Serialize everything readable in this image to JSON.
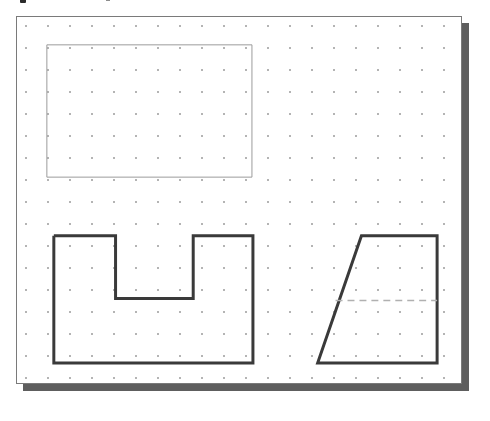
{
  "document": {
    "title": "Engineering drawing sheet",
    "background_color": "#ffffff"
  },
  "top_artifacts": [
    {
      "name": "cut-off-mark-left",
      "label": ""
    },
    {
      "name": "cut-off-mark-right",
      "label": ""
    }
  ],
  "canvas": {
    "name": "drawing-canvas",
    "x": 16,
    "y": 16,
    "width": 446,
    "height": 368,
    "fill_color": "#ffffff",
    "border_color": "#7a7a7a",
    "shadow_color": "#5e5e5e",
    "shadow_offset": 7
  },
  "grid": {
    "name": "dot-grid",
    "type": "dots",
    "spacing": 22,
    "dot_color": "#b4b4b4",
    "dot_radius": 1,
    "origin_x": 8,
    "origin_y": 8
  },
  "shapes": [
    {
      "id": "rectangle",
      "name": "rectangle-outline",
      "kind": "rectangle",
      "stroke_color": "#9a9a9a",
      "stroke_width": 1,
      "fill": "none",
      "x": 30,
      "y": 28,
      "width": 206,
      "height": 133,
      "points": "30,28 236,28 236,161 30,161 30,28"
    },
    {
      "id": "u-channel",
      "name": "u-channel-profile",
      "kind": "polygon",
      "stroke_color": "#3a3a3a",
      "stroke_width": 3,
      "fill": "none",
      "points": "37,220 99,220 99,283 177,283 177,220 237,220 237,348 37,348 37,220"
    },
    {
      "id": "trapezoid",
      "name": "trapezoid-profile",
      "kind": "polygon",
      "stroke_color": "#3a3a3a",
      "stroke_width": 3,
      "fill": "none",
      "points": "346,220 422,220 422,348 302,348 346,220"
    }
  ],
  "construction_lines": [
    {
      "id": "centerline",
      "name": "trapezoid-centerline",
      "kind": "dashed-line",
      "stroke_color": "#b0b0b0",
      "stroke_width": 1.4,
      "dash_pattern": "7 5",
      "x1": 320,
      "y1": 285,
      "x2": 422,
      "y2": 285
    }
  ]
}
